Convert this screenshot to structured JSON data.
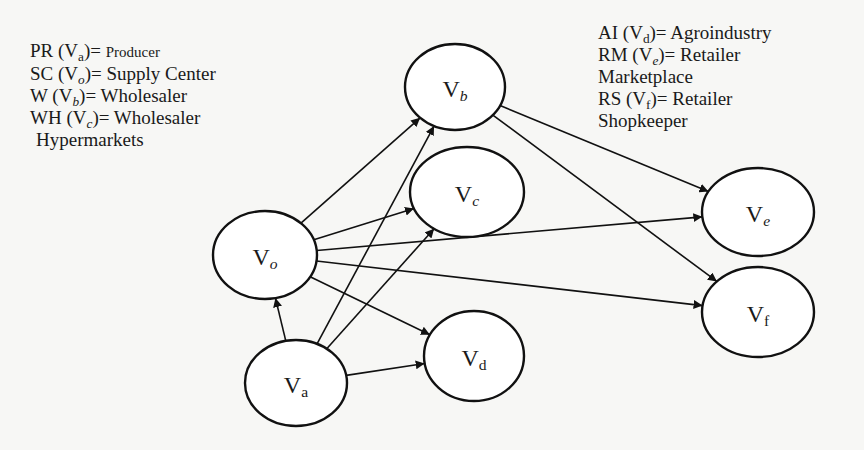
{
  "legend_left": [
    {
      "abbr": "PR",
      "var": "V",
      "sub": "a",
      "sub_italic": false,
      "name": "Producer",
      "name_small": true
    },
    {
      "abbr": "SC",
      "var": "V",
      "sub": "o",
      "sub_italic": true,
      "name": "Supply Center",
      "name_small": false
    },
    {
      "abbr": "W",
      "var": "V",
      "sub": "b",
      "sub_italic": true,
      "name": "Wholesaler",
      "name_small": false
    },
    {
      "abbr": "WH",
      "var": "V",
      "sub": "c",
      "sub_italic": true,
      "name": "Wholesaler",
      "name_small": false
    },
    {
      "continuation": "Hypermarkets"
    }
  ],
  "legend_right": [
    {
      "abbr": "AI",
      "var": "V",
      "sub": "d",
      "sub_italic": false,
      "name": "Agroindustry"
    },
    {
      "abbr": "RM",
      "var": "V",
      "sub": "e",
      "sub_italic": true,
      "name": "Retailer"
    },
    {
      "continuation": "Marketplace"
    },
    {
      "abbr": "RS",
      "var": "V",
      "sub": "f",
      "sub_italic": false,
      "name": "Retailer"
    },
    {
      "continuation": "Shopkeeper"
    }
  ],
  "nodes": [
    {
      "id": "Va",
      "label": "V",
      "sub": "a",
      "sub_italic": false,
      "cx": 296,
      "cy": 383,
      "rx": 51,
      "ry": 43
    },
    {
      "id": "Vo",
      "label": "V",
      "sub": "o",
      "sub_italic": true,
      "cx": 265,
      "cy": 255,
      "rx": 52,
      "ry": 44
    },
    {
      "id": "Vb",
      "label": "V",
      "sub": "b",
      "sub_italic": true,
      "cx": 455,
      "cy": 87,
      "rx": 50,
      "ry": 43
    },
    {
      "id": "Vc",
      "label": "V",
      "sub": "c",
      "sub_italic": true,
      "cx": 467,
      "cy": 192,
      "rx": 57,
      "ry": 45
    },
    {
      "id": "Vd",
      "label": "V",
      "sub": "d",
      "sub_italic": false,
      "cx": 474,
      "cy": 356,
      "rx": 50,
      "ry": 45
    },
    {
      "id": "Ve",
      "label": "V",
      "sub": "e",
      "sub_italic": true,
      "cx": 758,
      "cy": 212,
      "rx": 56,
      "ry": 44
    },
    {
      "id": "Vf",
      "label": "V",
      "sub": "f",
      "sub_italic": false,
      "cx": 758,
      "cy": 312,
      "rx": 56,
      "ry": 45
    }
  ],
  "edges": [
    {
      "from": "Va",
      "to": "Vo"
    },
    {
      "from": "Va",
      "to": "Vb"
    },
    {
      "from": "Va",
      "to": "Vc"
    },
    {
      "from": "Va",
      "to": "Vd"
    },
    {
      "from": "Vo",
      "to": "Vb"
    },
    {
      "from": "Vo",
      "to": "Vc"
    },
    {
      "from": "Vo",
      "to": "Vd"
    },
    {
      "from": "Vo",
      "to": "Ve"
    },
    {
      "from": "Vo",
      "to": "Vf"
    },
    {
      "from": "Vb",
      "to": "Ve"
    },
    {
      "from": "Vb",
      "to": "Vf"
    }
  ],
  "colors": {
    "stroke": "#111111",
    "background": "#f7f7f5",
    "node_fill": "#ffffff"
  }
}
